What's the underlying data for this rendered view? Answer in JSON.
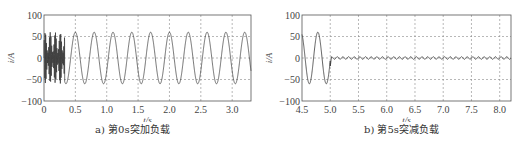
{
  "chart_data": [
    {
      "type": "line",
      "title": "",
      "caption": "a) 第0s突加负载",
      "xlabel": "t/s",
      "ylabel": "i/A",
      "xlim": [
        0,
        3.3
      ],
      "ylim": [
        -100,
        100
      ],
      "xticks": [
        0,
        0.5,
        1.0,
        1.5,
        2.0,
        2.5,
        3.0
      ],
      "xtick_labels": [
        "0",
        "0.5",
        "1.0",
        "1.5",
        "2.0",
        "2.5",
        "3.0"
      ],
      "yticks": [
        -100,
        -50,
        0,
        50,
        100
      ],
      "ytick_labels": [
        "-100",
        "-50",
        "0",
        "50",
        "100"
      ],
      "grid": true,
      "series": [
        {
          "name": "current",
          "description": "dense transient oscillation 0-0.3s (amplitude up to ~60A), then steady sinusoid amplitude ~60A, period ~0.3s",
          "transient_end": 0.33,
          "amplitude": 60,
          "period": 0.3,
          "peaks_t": [
            0.5,
            0.8,
            1.1,
            1.4,
            1.7,
            2.0,
            2.3,
            2.6,
            2.9,
            3.25
          ]
        }
      ]
    },
    {
      "type": "line",
      "title": "",
      "caption": "b) 第5s突减负载",
      "xlabel": "t/s",
      "ylabel": "i/A",
      "xlim": [
        4.5,
        8.2
      ],
      "ylim": [
        -100,
        100
      ],
      "xticks": [
        4.5,
        5.0,
        5.5,
        6.0,
        6.5,
        7.0,
        7.5,
        8.0
      ],
      "xtick_labels": [
        "4.5",
        "5.0",
        "5.5",
        "6.0",
        "6.5",
        "7.0",
        "7.5",
        "8.0"
      ],
      "yticks": [
        -100,
        -50,
        0,
        50,
        100
      ],
      "ytick_labels": [
        "-100",
        "-50",
        "0",
        "50",
        "100"
      ],
      "grid": true,
      "series": [
        {
          "name": "current",
          "description": "sinusoid amplitude ~60A until 5.0s, then drops to near zero with small ripple (~3A)",
          "amplitude_before": 60,
          "period": 0.3,
          "step_time": 5.0,
          "amplitude_after": 3
        }
      ]
    }
  ]
}
